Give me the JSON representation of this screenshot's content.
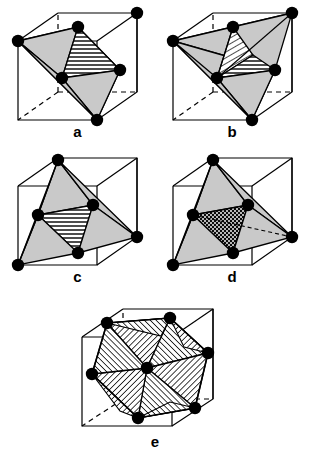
{
  "figure": {
    "background_color": "#ffffff",
    "line_color": "#000000",
    "vertex_color": "#000000",
    "face_fill_color": "#c8c8c8",
    "hatch_color": "#000000",
    "width": 309,
    "height": 453
  },
  "panels": [
    {
      "id": "a",
      "label": "a",
      "shape_name": "tetrahedron-in-cube",
      "vertex_count": 4,
      "hatch_style": "horizontal",
      "hatch_face_count": 1
    },
    {
      "id": "b",
      "label": "b",
      "shape_name": "tetrahedron-in-cube-two-hatched-faces",
      "vertex_count": 4,
      "hatch_style": "horizontal-and-diagonal",
      "hatch_face_count": 2
    },
    {
      "id": "c",
      "label": "c",
      "shape_name": "octahedron-in-cube",
      "vertex_count": 5,
      "hatch_style": "horizontal",
      "hatch_face_count": 1
    },
    {
      "id": "d",
      "label": "d",
      "shape_name": "octahedron-in-cube-cross-hatched",
      "vertex_count": 5,
      "hatch_style": "cross-hatch",
      "hatch_face_count": 1
    },
    {
      "id": "e",
      "label": "e",
      "shape_name": "cuboctahedron-in-cube",
      "vertex_count": 7,
      "hatch_style": "diagonal",
      "hatch_face_count": 8
    }
  ]
}
